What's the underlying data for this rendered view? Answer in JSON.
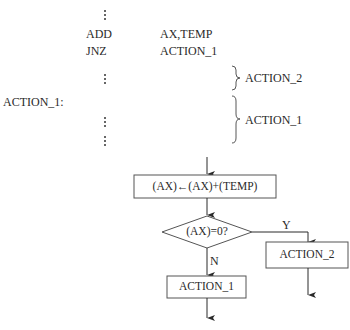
{
  "code": {
    "lines": [
      {
        "op": "",
        "arg": "",
        "ellipsis": true
      },
      {
        "op": "ADD",
        "arg": "AX,TEMP"
      },
      {
        "op": "JNZ",
        "arg": "ACTION_1"
      },
      {
        "op": "",
        "arg": "",
        "ellipsis": true
      }
    ],
    "label": "ACTION_1:",
    "braces": [
      {
        "label": "ACTION_2"
      },
      {
        "label": "ACTION_1"
      }
    ]
  },
  "flowchart": {
    "process": "(AX)←(AX)+(TEMP)",
    "decision": "(AX)=0?",
    "yes_label": "Y",
    "no_label": "N",
    "action_yes": "ACTION_2",
    "action_no": "ACTION_1"
  }
}
